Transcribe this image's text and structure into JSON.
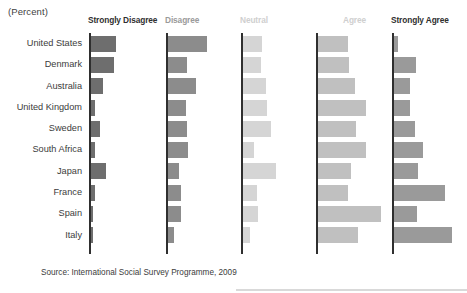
{
  "unit_label": "(Percent)",
  "source_note": "Source: International Social Survey Programme, 2009",
  "colors": {
    "strongly_disagree": "#6e6e6e",
    "disagree": "#8c8c8c",
    "neutral": "#d5d5d5",
    "agree": "#c0c0c0",
    "strongly_agree": "#9a9a9a",
    "axis": "#2f2f2f",
    "text": "#3b3b3b",
    "header_dark": "#2f2f2f",
    "header_mid": "#9a9a9a",
    "header_light": "#cfcfcf"
  },
  "chart_data": {
    "type": "bar",
    "title": "",
    "subtitle": "",
    "xlabel": "",
    "ylabel": "",
    "unit": "(Percent)",
    "orientation": "horizontal",
    "layout": "small-multiples",
    "grid": false,
    "legend_position": "top-as-panel-headers",
    "xlim": [
      0,
      60
    ],
    "categories": [
      "United States",
      "Denmark",
      "Australia",
      "United Kingdom",
      "Sweden",
      "South Africa",
      "Japan",
      "France",
      "Spain",
      "Italy"
    ],
    "series": [
      {
        "name": "Strongly Disagree",
        "color": "#6e6e6e",
        "values": [
          23,
          21,
          11,
          4,
          8,
          4,
          14,
          4,
          2,
          1
        ]
      },
      {
        "name": "Disagree",
        "color": "#8c8c8c",
        "values": [
          35,
          17,
          25,
          16,
          17,
          18,
          10,
          12,
          12,
          6
        ]
      },
      {
        "name": "Neutral",
        "color": "#d5d5d5",
        "values": [
          17,
          16,
          21,
          22,
          25,
          10,
          30,
          13,
          14,
          7
        ]
      },
      {
        "name": "Agree",
        "color": "#c0c0c0",
        "values": [
          27,
          28,
          33,
          43,
          34,
          43,
          30,
          27,
          57,
          36
        ]
      },
      {
        "name": "Strongly Agree",
        "color": "#9a9a9a",
        "values": [
          4,
          20,
          15,
          15,
          19,
          26,
          22,
          46,
          21,
          52
        ]
      }
    ]
  },
  "panels": [
    {
      "key": "strongly_disagree",
      "label": "Strongly Disagree",
      "header_tone": "dark",
      "axis_x": 89,
      "header_x": 88,
      "scale": 1.0,
      "color": "#6e6e6e"
    },
    {
      "key": "disagree",
      "label": "Disagree",
      "header_tone": "mid",
      "axis_x": 166,
      "header_x": 165,
      "scale": 1.0,
      "color": "#8c8c8c"
    },
    {
      "key": "neutral",
      "label": "Neutral",
      "header_tone": "light",
      "axis_x": 241,
      "header_x": 240,
      "scale": 1.0,
      "color": "#d5d5d5"
    },
    {
      "key": "agree",
      "label": "Agree",
      "header_tone": "light",
      "axis_x": 316,
      "header_x": 343,
      "scale": 1.0,
      "color": "#c0c0c0"
    },
    {
      "key": "strongly_agree",
      "label": "Strongly Agree",
      "header_tone": "dark",
      "axis_x": 392,
      "header_x": 391,
      "scale": 1.0,
      "color": "#9a9a9a"
    }
  ]
}
